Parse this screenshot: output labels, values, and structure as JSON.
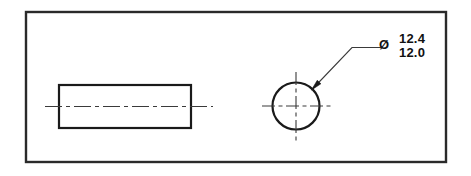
{
  "drawing": {
    "title": "Engineering part drawing - cylindrical shaft",
    "background_color": "#ffffff",
    "line_color": "#1a1a1a",
    "border_color": "#2a2a2a",
    "centerline_color": "#3a3a3a",
    "leader_color": "#3a3a3a",
    "text_color": "#111111",
    "border": {
      "name": "drawing-frame",
      "x": 26,
      "y": 12,
      "width": 420,
      "height": 150,
      "stroke_width": 2.4
    },
    "views": [
      {
        "name": "side-view",
        "type": "rectangle",
        "x": 59,
        "y": 85,
        "width": 132,
        "height": 43,
        "stroke_width": 2.2,
        "centerline": {
          "name": "side-view-centerline",
          "x1": 45,
          "y1": 106.5,
          "x2": 213,
          "y2": 106.5
        }
      },
      {
        "name": "end-view",
        "type": "circle",
        "cx": 296,
        "cy": 106,
        "r": 23.5,
        "stroke_width": 2.2,
        "centerlines": {
          "horizontal": {
            "x1": 262,
            "y1": 106,
            "x2": 331,
            "y2": 106
          },
          "vertical": {
            "x1": 296,
            "y1": 72,
            "x2": 296,
            "y2": 141
          }
        }
      }
    ],
    "leader": {
      "name": "diameter-leader",
      "arrow_tip_x": 311.5,
      "arrow_tip_y": 90,
      "elbow_x": 352,
      "elbow_y": 47.5,
      "shelf_end_x": 381,
      "shelf_end_y": 47.5,
      "stroke_width": 1.1,
      "arrow_length": 11,
      "arrow_width": 5
    },
    "annotation": {
      "name": "diameter-dimension",
      "symbol": "Ø",
      "symbol_x": 384,
      "symbol_y": 49,
      "upper_limit": "12.4",
      "lower_limit": "12.0",
      "value_x": 399,
      "upper_y": 43,
      "lower_y": 57
    }
  }
}
